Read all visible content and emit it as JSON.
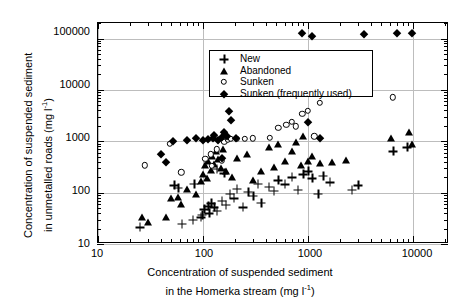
{
  "chart_data": {
    "type": "scatter",
    "title": "",
    "xlabel_line1": "Concentration of suspended sediment",
    "xlabel_line2_pre": "in the Homerka stream (mg l",
    "xlabel_sup": "-1",
    "xlabel_line2_post": ")",
    "ylabel_line1": "Concentration of suspended sediment",
    "ylabel_line2_pre": "in unmetalled roads (mg l",
    "ylabel_sup": "-1",
    "ylabel_line2_post": ")",
    "xscale": "log",
    "yscale": "log",
    "xlim": [
      10,
      22000
    ],
    "ylim": [
      10,
      200000
    ],
    "xticks": [
      10,
      100,
      1000,
      10000
    ],
    "xtick_labels": [
      "10",
      "100",
      "1000",
      "10000"
    ],
    "yticks": [
      10,
      100,
      1000,
      10000,
      100000
    ],
    "ytick_labels": [
      "10",
      "100",
      "1000",
      "10000",
      "100000"
    ],
    "grid": true,
    "legend_position": "top-left",
    "series": [
      {
        "name": "New",
        "marker": "plus",
        "points": [
          [
            25,
            21
          ],
          [
            63,
            25
          ],
          [
            80,
            30
          ],
          [
            95,
            33
          ],
          [
            98,
            37
          ],
          [
            103,
            48
          ],
          [
            112,
            55
          ],
          [
            115,
            40
          ],
          [
            120,
            62
          ],
          [
            128,
            52
          ],
          [
            135,
            44
          ],
          [
            150,
            70
          ],
          [
            165,
            58
          ],
          [
            180,
            95
          ],
          [
            195,
            78
          ],
          [
            210,
            120
          ],
          [
            240,
            52
          ],
          [
            270,
            105
          ],
          [
            300,
            88
          ],
          [
            330,
            150
          ],
          [
            360,
            64
          ],
          [
            420,
            130
          ],
          [
            470,
            110
          ],
          [
            520,
            175
          ],
          [
            600,
            145
          ],
          [
            700,
            200
          ],
          [
            800,
            115
          ],
          [
            900,
            230
          ],
          [
            1000,
            260
          ],
          [
            1100,
            190
          ],
          [
            1250,
            95
          ],
          [
            1400,
            215
          ],
          [
            1600,
            160
          ],
          [
            2600,
            115
          ],
          [
            3000,
            140
          ],
          [
            6500,
            640
          ],
          [
            8800,
            760
          ],
          [
            53,
            140
          ],
          [
            58,
            125
          ],
          [
            82,
            150
          ],
          [
            135,
            290
          ],
          [
            160,
            240
          ]
        ]
      },
      {
        "name": "Abandoned",
        "marker": "triangle",
        "points": [
          [
            26,
            33
          ],
          [
            30,
            27
          ],
          [
            44,
            34
          ],
          [
            50,
            78
          ],
          [
            58,
            82
          ],
          [
            62,
            60
          ],
          [
            70,
            120
          ],
          [
            86,
            95
          ],
          [
            95,
            165
          ],
          [
            100,
            230
          ],
          [
            104,
            340
          ],
          [
            108,
            190
          ],
          [
            112,
            420
          ],
          [
            118,
            280
          ],
          [
            122,
            520
          ],
          [
            128,
            360
          ],
          [
            132,
            640
          ],
          [
            140,
            450
          ],
          [
            148,
            300
          ],
          [
            156,
            700
          ],
          [
            165,
            270
          ],
          [
            190,
            205
          ],
          [
            210,
            480
          ],
          [
            260,
            560
          ],
          [
            300,
            175
          ],
          [
            360,
            260
          ],
          [
            420,
            780
          ],
          [
            470,
            320
          ],
          [
            520,
            880
          ],
          [
            600,
            420
          ],
          [
            700,
            640
          ],
          [
            760,
            980
          ],
          [
            850,
            340
          ],
          [
            900,
            1250
          ],
          [
            1000,
            420
          ],
          [
            1100,
            520
          ],
          [
            1300,
            380
          ],
          [
            1700,
            400
          ],
          [
            2300,
            430
          ],
          [
            6200,
            1150
          ],
          [
            9200,
            1500
          ],
          [
            9700,
            880
          ]
        ]
      },
      {
        "name": "Sunken",
        "marker": "circle",
        "points": [
          [
            28,
            340
          ],
          [
            48,
            900
          ],
          [
            62,
            250
          ],
          [
            105,
            460
          ],
          [
            118,
            560
          ],
          [
            122,
            330
          ],
          [
            135,
            700
          ],
          [
            150,
            420
          ],
          [
            160,
            980
          ],
          [
            172,
            1050
          ],
          [
            185,
            1100
          ],
          [
            210,
            1120
          ],
          [
            250,
            1130
          ],
          [
            300,
            1140
          ],
          [
            430,
            1150
          ],
          [
            520,
            1800
          ],
          [
            620,
            2100
          ],
          [
            700,
            2400
          ],
          [
            760,
            1950
          ],
          [
            880,
            3400
          ],
          [
            1000,
            3900
          ],
          [
            1150,
            1250
          ],
          [
            1300,
            5600
          ],
          [
            6400,
            7200
          ]
        ]
      },
      {
        "name": "Sunken (frequently used)",
        "marker": "diamond",
        "points": [
          [
            40,
            560
          ],
          [
            44,
            390
          ],
          [
            52,
            1000
          ],
          [
            70,
            1050
          ],
          [
            86,
            1150
          ],
          [
            100,
            1080
          ],
          [
            112,
            1120
          ],
          [
            124,
            1160
          ],
          [
            128,
            1300
          ],
          [
            140,
            1050
          ],
          [
            150,
            1200
          ],
          [
            158,
            1500
          ],
          [
            168,
            1280
          ],
          [
            178,
            3900
          ],
          [
            186,
            2600
          ],
          [
            205,
            1180
          ],
          [
            290,
            9400
          ],
          [
            420,
            10000
          ],
          [
            500,
            9700
          ],
          [
            620,
            20000
          ],
          [
            880,
            130000
          ],
          [
            1100,
            110000
          ],
          [
            1250,
            14500
          ],
          [
            2700,
            12000
          ],
          [
            3400,
            120000
          ],
          [
            7000,
            130000
          ],
          [
            9800,
            130000
          ],
          [
            1000,
            2400
          ],
          [
            1300,
            1150
          ],
          [
            150,
            480
          ]
        ]
      }
    ]
  }
}
